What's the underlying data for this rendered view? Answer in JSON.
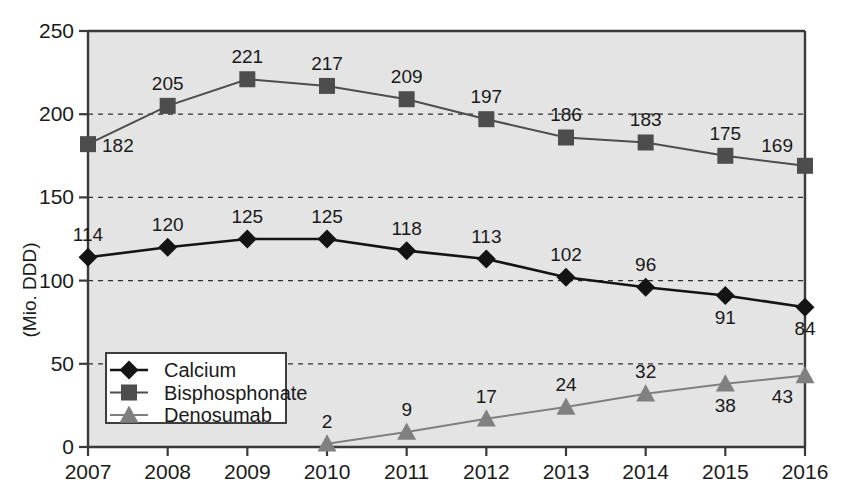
{
  "chart_data": {
    "type": "line",
    "title": "",
    "subtitle": "",
    "xlabel": "",
    "ylabel": "(Mio. DDD)",
    "categories": [
      "2007",
      "2008",
      "2009",
      "2010",
      "2011",
      "2012",
      "2013",
      "2014",
      "2015",
      "2016"
    ],
    "x": [
      2007,
      2008,
      2009,
      2010,
      2011,
      2012,
      2013,
      2014,
      2015,
      2016
    ],
    "xlim": [
      2007,
      2016
    ],
    "ylim": [
      0,
      250
    ],
    "yticks": [
      "0",
      "50",
      "100",
      "150",
      "200",
      "250"
    ],
    "ytick_values": [
      0,
      50,
      100,
      150,
      200,
      250
    ],
    "grid": "horizontal-dashed",
    "legend_position": "lower-left-inside",
    "plot_background": "#e4e4e4",
    "series": [
      {
        "name": "Calcium",
        "marker": "diamond",
        "color": "#141414",
        "values": [
          114,
          120,
          125,
          125,
          118,
          113,
          102,
          96,
          91,
          84
        ],
        "labels": [
          "114",
          "120",
          "125",
          "125",
          "118",
          "113",
          "102",
          "96",
          "91",
          "84"
        ],
        "label_side": [
          "above",
          "above",
          "above",
          "above",
          "above",
          "above",
          "above",
          "above",
          "below",
          "below"
        ]
      },
      {
        "name": "Bisphosphonate",
        "marker": "square",
        "color": "#4d4d4d",
        "values": [
          182,
          205,
          221,
          217,
          209,
          197,
          186,
          183,
          175,
          169
        ],
        "labels": [
          "182",
          "205",
          "221",
          "217",
          "209",
          "197",
          "186",
          "183",
          "175",
          "169"
        ],
        "label_side": [
          "right",
          "above",
          "above",
          "above",
          "above",
          "above",
          "above",
          "above",
          "above",
          "above-left"
        ]
      },
      {
        "name": "Denosumab",
        "marker": "triangle",
        "color": "#808080",
        "values": [
          null,
          null,
          null,
          2,
          9,
          17,
          24,
          32,
          38,
          43
        ],
        "labels": [
          "",
          "",
          "",
          "2",
          "9",
          "17",
          "24",
          "32",
          "38",
          "43"
        ],
        "label_side": [
          "",
          "",
          "",
          "above",
          "above",
          "above",
          "above",
          "above",
          "below",
          "below-left"
        ]
      }
    ]
  },
  "legend": {
    "items": [
      {
        "label": "Calcium"
      },
      {
        "label": "Bisphosphonate"
      },
      {
        "label": "Denosumab"
      }
    ]
  }
}
